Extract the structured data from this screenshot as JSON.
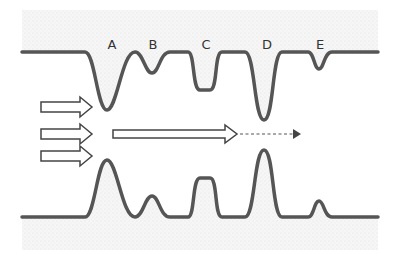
{
  "diagram": {
    "labels": [
      {
        "id": "A",
        "text": "A",
        "x": 112,
        "y": 49
      },
      {
        "id": "B",
        "text": "B",
        "x": 153,
        "y": 49
      },
      {
        "id": "C",
        "text": "C",
        "x": 206,
        "y": 49
      },
      {
        "id": "D",
        "text": "D",
        "x": 267,
        "y": 49
      },
      {
        "id": "E",
        "text": "E",
        "x": 320,
        "y": 49
      }
    ],
    "inlet_arrows": 3,
    "main_arrow": "solid hollow arrow continuing into dashed arrow",
    "colors": {
      "wall": "#555555",
      "arrow_stroke": "#444444",
      "arrow_fill": "#ffffff",
      "background_texture": "#f2f2f2",
      "label": "#333333"
    }
  }
}
